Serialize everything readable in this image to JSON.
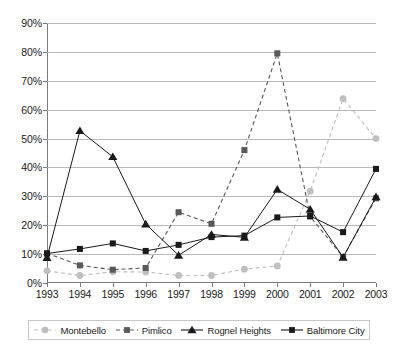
{
  "chart_data": {
    "type": "line",
    "title": "",
    "subtitle": "",
    "xlabel": "",
    "ylabel": "",
    "grid": true,
    "legend_position": "bottom",
    "x": [
      "1993",
      "1994",
      "1995",
      "1996",
      "1997",
      "1998",
      "1999",
      "2000",
      "2001",
      "2002",
      "2003"
    ],
    "categories": [
      "1993",
      "1994",
      "1995",
      "1996",
      "1997",
      "1998",
      "1999",
      "2000",
      "2001",
      "2002",
      "2003"
    ],
    "ylim": [
      0,
      90
    ],
    "yticks": [
      0,
      10,
      20,
      30,
      40,
      50,
      60,
      70,
      80,
      90
    ],
    "ytick_labels": [
      "0%",
      "10%",
      "20%",
      "30%",
      "40%",
      "50%",
      "60%",
      "70%",
      "80%",
      "90%"
    ],
    "y_unit": "%",
    "series": [
      {
        "name": "Montebello",
        "color": "#bfbfbf",
        "marker": "circle",
        "line_style": "dashed",
        "values": [
          4.2,
          2.6,
          3.9,
          3.8,
          2.6,
          2.6,
          4.8,
          5.9,
          31.8,
          63.8,
          50.0
        ]
      },
      {
        "name": "Pimlico",
        "color": "#595959",
        "marker": "square",
        "line_style": "dashed",
        "values": [
          10.3,
          6.1,
          4.6,
          5.2,
          24.5,
          20.5,
          46.0,
          79.5,
          23.0,
          9.0,
          29.3
        ]
      },
      {
        "name": "Rognel Heights",
        "color": "#1a1a1a",
        "marker": "triangle",
        "line_style": "solid",
        "values": [
          8.8,
          52.7,
          43.7,
          20.4,
          9.6,
          16.8,
          15.8,
          32.4,
          25.5,
          8.9,
          29.8
        ]
      },
      {
        "name": "Baltimore City",
        "color": "#1a1a1a",
        "marker": "square",
        "line_style": "solid",
        "values": [
          10.2,
          11.8,
          13.7,
          11.1,
          13.2,
          15.9,
          16.4,
          22.7,
          23.2,
          17.6,
          39.5
        ]
      }
    ]
  },
  "legend": {
    "items": [
      {
        "label": "Montebello"
      },
      {
        "label": "Pimlico"
      },
      {
        "label": "Rognel Heights"
      },
      {
        "label": "Baltimore City"
      }
    ]
  }
}
